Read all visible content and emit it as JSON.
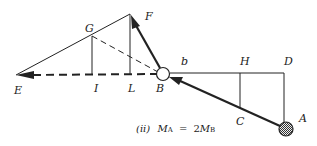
{
  "diagram": {
    "labels": {
      "F": "F",
      "G": "G",
      "E": "E",
      "I": "I",
      "L": "L",
      "B": "B",
      "b": "b",
      "H": "H",
      "D": "D",
      "C": "C",
      "A": "A"
    },
    "caption": {
      "prefix": "(ii)",
      "lhs_var": "M",
      "lhs_sub": "A",
      "equals": "=",
      "coef": "2",
      "rhs_var": "M",
      "rhs_sub": "B"
    },
    "colors": {
      "line": "#222222",
      "background": "#ffffff"
    }
  }
}
